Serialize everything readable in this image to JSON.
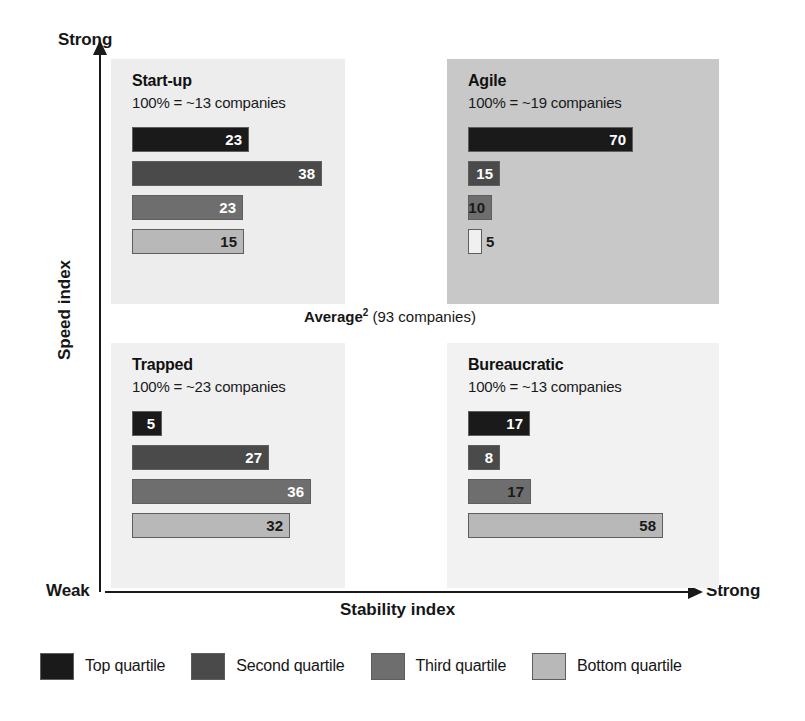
{
  "axes": {
    "y_title": "Speed index",
    "y_high_label": "Strong",
    "x_title": "Stability index",
    "x_low_label": "Weak",
    "x_high_label": "Strong"
  },
  "average_note": {
    "bold_part": "Average",
    "footnote_marker": "2",
    "rest": " (93 companies)",
    "full_text": "Average2 (93 companies)"
  },
  "colors": {
    "top_quartile": "#1a1a1a",
    "second_quartile": "#4a4a4a",
    "third_quartile": "#6e6e6e",
    "bottom_quartile": "#b8b8b8",
    "panel_startup_bg": "#ededed",
    "panel_agile_bg": "#c8c8c8",
    "panel_trapped_bg": "#f0f0f0",
    "panel_bureaucratic_bg": "#f2f2f2",
    "axis": "#1a1a1a",
    "text": "#161616"
  },
  "legend": {
    "items": [
      {
        "label": "Top quartile",
        "color": "#1a1a1a"
      },
      {
        "label": "Second quartile",
        "color": "#4a4a4a"
      },
      {
        "label": "Third quartile",
        "color": "#6e6e6e"
      },
      {
        "label": "Bottom quartile",
        "color": "#b8b8b8"
      }
    ]
  },
  "panels": [
    {
      "key": "startup",
      "title": "Start-up",
      "subtitle": "100% = ~13 companies",
      "background": "#ededed",
      "box": {
        "left": 111,
        "top": 59,
        "width": 234,
        "height": 245
      },
      "bars": [
        {
          "quartile": "Top quartile",
          "value": 23,
          "label": "23",
          "color": "#1a1a1a",
          "px": 117,
          "label_pos": "inside"
        },
        {
          "quartile": "Second quartile",
          "value": 38,
          "label": "38",
          "color": "#4a4a4a",
          "px": 190,
          "label_pos": "inside"
        },
        {
          "quartile": "Third quartile",
          "value": 23,
          "label": "23",
          "color": "#6e6e6e",
          "px": 111,
          "label_pos": "inside"
        },
        {
          "quartile": "Bottom quartile",
          "value": 15,
          "label": "15",
          "color": "#b8b8b8",
          "px": 112,
          "label_pos": "inside-dark"
        }
      ]
    },
    {
      "key": "agile",
      "title": "Agile",
      "subtitle": "100% = ~19 companies",
      "background": "#c8c8c8",
      "box": {
        "left": 447,
        "top": 59,
        "width": 272,
        "height": 245
      },
      "bars": [
        {
          "quartile": "Top quartile",
          "value": 70,
          "label": "70",
          "color": "#1a1a1a",
          "px": 165,
          "label_pos": "inside"
        },
        {
          "quartile": "Second quartile",
          "value": 15,
          "label": "15",
          "color": "#4a4a4a",
          "px": 32,
          "label_pos": "inside"
        },
        {
          "quartile": "Third quartile",
          "value": 10,
          "label": "10",
          "color": "#6e6e6e",
          "px": 24,
          "label_pos": "inside-dark"
        },
        {
          "quartile": "Bottom quartile",
          "value": 5,
          "label": "5",
          "color": "#f0f0f0",
          "px": 14,
          "label_pos": "outside"
        }
      ]
    },
    {
      "key": "trapped",
      "title": "Trapped",
      "subtitle": "100% = ~23 companies",
      "background": "#f0f0f0",
      "box": {
        "left": 111,
        "top": 343,
        "width": 234,
        "height": 245
      },
      "bars": [
        {
          "quartile": "Top quartile",
          "value": 5,
          "label": "5",
          "color": "#1a1a1a",
          "px": 30,
          "label_pos": "inside"
        },
        {
          "quartile": "Second quartile",
          "value": 27,
          "label": "27",
          "color": "#4a4a4a",
          "px": 137,
          "label_pos": "inside"
        },
        {
          "quartile": "Third quartile",
          "value": 36,
          "label": "36",
          "color": "#6e6e6e",
          "px": 179,
          "label_pos": "inside"
        },
        {
          "quartile": "Bottom quartile",
          "value": 32,
          "label": "32",
          "color": "#b8b8b8",
          "px": 158,
          "label_pos": "inside-dark"
        }
      ]
    },
    {
      "key": "bureaucratic",
      "title": "Bureaucratic",
      "subtitle": "100% = ~13 companies",
      "background": "#f2f2f2",
      "box": {
        "left": 447,
        "top": 343,
        "width": 272,
        "height": 245
      },
      "bars": [
        {
          "quartile": "Top quartile",
          "value": 17,
          "label": "17",
          "color": "#1a1a1a",
          "px": 62,
          "label_pos": "inside"
        },
        {
          "quartile": "Second quartile",
          "value": 8,
          "label": "8",
          "color": "#4a4a4a",
          "px": 32,
          "label_pos": "inside"
        },
        {
          "quartile": "Third quartile",
          "value": 17,
          "label": "17",
          "color": "#6e6e6e",
          "px": 63,
          "label_pos": "inside-dark"
        },
        {
          "quartile": "Bottom quartile",
          "value": 58,
          "label": "58",
          "color": "#b8b8b8",
          "px": 195,
          "label_pos": "inside-dark"
        }
      ]
    }
  ],
  "chart_data": {
    "type": "bar",
    "title": "",
    "subtitle": "Average2 (93 companies)",
    "xlabel": "Stability index",
    "ylabel": "Speed index",
    "layout": "2x2 quadrant matrix of grouped horizontal bar charts",
    "units": "percent of companies",
    "grid": false,
    "legend_position": "bottom",
    "x_axis_range_labels": [
      "Weak",
      "Strong"
    ],
    "y_axis_range_labels": [
      "Weak",
      "Strong"
    ],
    "series": [
      {
        "name": "Top quartile",
        "values": [
          23,
          70,
          5,
          17
        ]
      },
      {
        "name": "Second quartile",
        "values": [
          38,
          15,
          27,
          8
        ]
      },
      {
        "name": "Third quartile",
        "values": [
          23,
          10,
          36,
          17
        ]
      },
      {
        "name": "Bottom quartile",
        "values": [
          15,
          5,
          32,
          58
        ]
      }
    ],
    "categories": [
      "Start-up",
      "Agile",
      "Trapped",
      "Bureaucratic"
    ],
    "category_totals": [
      "~13 companies",
      "~19 companies",
      "~23 companies",
      "~13 companies"
    ],
    "total_companies": 93,
    "annotations": [
      "Average2 (93 companies)"
    ]
  }
}
